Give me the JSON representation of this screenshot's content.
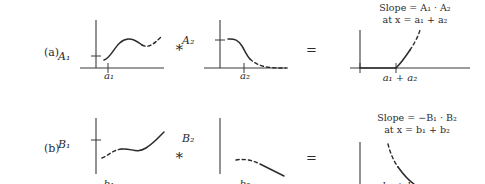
{
  "figure": {
    "rows": [
      {
        "id": "a",
        "row_label": "(a)",
        "panels": [
          {
            "name": "first-operand",
            "y_axis_label": "A₁",
            "x_tick_label": "a₁",
            "curve": "rises from low left, peaks mid, dips then rises at right; solid on left portion, dashed on right portion"
          },
          {
            "name": "second-operand",
            "y_axis_label": "A₂",
            "x_tick_label": "a₂",
            "curve": "starts high flat at left, falls steeply, decays toward zero; solid on left, dashed tail"
          },
          {
            "name": "result",
            "x_tick_label": "a₁ + a₂",
            "annotation_line1": "Slope = A₁ · A₂",
            "annotation_line2": "at x = a₁ + a₂",
            "curve": "flat at zero, then rises steeply upward from the tick; solid lower part, dashed upper part"
          }
        ],
        "operators": {
          "convolve": "∗",
          "equals": "="
        }
      },
      {
        "id": "b",
        "row_label": "(b)",
        "panels": [
          {
            "name": "first-operand",
            "y_axis_label": "B₁",
            "x_tick_label": "b₁",
            "curve": "dips low at left, troughs, then rises to the right; dashed on left portion, solid on right portion"
          },
          {
            "name": "second-operand",
            "y_axis_label": "B₂",
            "x_tick_label": "b₂",
            "curve": "starts high at left and falls away to the right; dashed on left, solid lower right"
          },
          {
            "name": "result",
            "x_tick_label": "b₁ + b₂",
            "annotation_line1": "Slope = −B₁ · B₂",
            "annotation_line2": "at x = b₁ + b₂",
            "curve": "descends steeply downward from the top; dashed upper part, solid lower part"
          }
        ],
        "operators": {
          "convolve": "∗",
          "equals": "="
        }
      }
    ],
    "colors": {
      "background": "#ffffff",
      "ink": "#2b2b2b",
      "axis": "#3a3a3a"
    }
  }
}
